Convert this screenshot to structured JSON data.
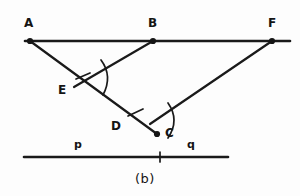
{
  "figure": {
    "caption": "(b)",
    "background_color": "#fdfdfd",
    "ink_color": "#1a1a1a",
    "width": 300,
    "height": 196
  },
  "points": [
    {
      "id": "A",
      "label": "A",
      "x": 30,
      "y": 41,
      "label_x": 24,
      "label_y": 17,
      "dot": true
    },
    {
      "id": "B",
      "label": "B",
      "x": 153,
      "y": 41,
      "label_x": 148,
      "label_y": 17,
      "dot": true
    },
    {
      "id": "F",
      "label": "F",
      "x": 272,
      "y": 41,
      "label_x": 268,
      "label_y": 17,
      "dot": true
    },
    {
      "id": "E",
      "label": "E",
      "x": 80,
      "y": 82,
      "label_x": 58,
      "label_y": 84,
      "dot": false
    },
    {
      "id": "D",
      "label": "D",
      "x": 133,
      "y": 118,
      "label_x": 111,
      "label_y": 120,
      "dot": false
    },
    {
      "id": "C",
      "label": "C",
      "x": 157,
      "y": 134,
      "label_x": 165,
      "label_y": 127,
      "dot": true
    }
  ],
  "segments": [
    {
      "name": "top-rail",
      "x1": 25,
      "y1": 41,
      "x2": 290,
      "y2": 41,
      "weight": "thick"
    },
    {
      "name": "a-to-c",
      "x1": 30,
      "y1": 41,
      "x2": 157,
      "y2": 134,
      "weight": "ray"
    },
    {
      "name": "b-to-e",
      "x1": 153,
      "y1": 41,
      "x2": 74,
      "y2": 87,
      "weight": "ray"
    },
    {
      "name": "f-to-c",
      "x1": 272,
      "y1": 41,
      "x2": 150,
      "y2": 124,
      "weight": "ray"
    }
  ],
  "bottom_line": {
    "name": "pq-line",
    "x1": 24,
    "y1": 157,
    "x2": 228,
    "y2": 157,
    "weight": "thick",
    "tick_x": 160,
    "tick_half_height": 5,
    "labels": [
      {
        "id": "p",
        "label": "p",
        "label_x": 74,
        "label_y": 139
      },
      {
        "id": "q",
        "label": "q",
        "label_x": 187,
        "label_y": 139
      }
    ]
  },
  "angle_marks": [
    {
      "name": "angle-at-e",
      "vertex_id": "E",
      "arc_path": "M 101 60 Q 113 76 103 95",
      "tick_path": "M 90 73 L 76 79"
    },
    {
      "name": "angle-at-d",
      "vertex_id": "D",
      "arc_path": "M 168 103 Q 180 120 168 138",
      "tick_path": "M 143 109 L 128 116"
    }
  ]
}
